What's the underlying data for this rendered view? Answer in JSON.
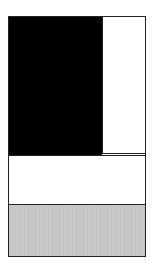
{
  "diagram": {
    "type": "rectangle-composition",
    "regions": [
      {
        "name": "black-block",
        "color": "#000000"
      },
      {
        "name": "right-white-panel",
        "color": "#ffffff"
      },
      {
        "name": "middle-white-band",
        "color": "#ffffff"
      },
      {
        "name": "bottom-gray-band",
        "color": "#c9c9c9"
      }
    ],
    "border_color": "#222222"
  }
}
